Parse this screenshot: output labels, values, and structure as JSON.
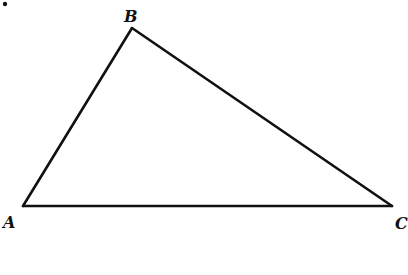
{
  "diagram": {
    "type": "triangle",
    "stroke_color": "#111111",
    "background": "#ffffff",
    "vertices": [
      {
        "name": "A",
        "x": 23,
        "y": 206
      },
      {
        "name": "B",
        "x": 132,
        "y": 28
      },
      {
        "name": "C",
        "x": 392,
        "y": 206
      }
    ],
    "labels": {
      "a": "A",
      "b": "B",
      "c": "C"
    },
    "marker_dot": {
      "x": 5,
      "y": 4
    }
  }
}
